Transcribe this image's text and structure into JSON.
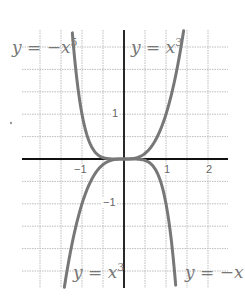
{
  "chart_data": {
    "type": "line",
    "title": "",
    "xlabel": "",
    "ylabel": "",
    "xlim": [
      -2.0,
      2.5
    ],
    "ylim": [
      -2.85,
      2.85
    ],
    "grid": true,
    "grid_step": 0.5,
    "x_ticks": [
      {
        "value": -1,
        "label": "−1"
      },
      {
        "value": 1,
        "label": "1"
      },
      {
        "value": 2,
        "label": "2"
      }
    ],
    "y_ticks": [
      {
        "value": 1,
        "label": "1"
      },
      {
        "value": -1,
        "label": "−1"
      }
    ],
    "series": [
      {
        "name": "y = x^3",
        "expr": "x^3",
        "x_range": [
          -1.42,
          1.42
        ],
        "color": "#777777"
      },
      {
        "name": "y = -x^5",
        "expr": "-x^5",
        "x_range": [
          -1.23,
          1.23
        ],
        "color": "#777777"
      }
    ],
    "annotations": [
      {
        "text": "y = −x",
        "sup": "5",
        "position": "top-left"
      },
      {
        "text": "y = x",
        "sup": "3",
        "position": "top-right"
      },
      {
        "text": "y = x",
        "sup": "3",
        "position": "bottom-left"
      },
      {
        "text": "y = −x",
        "sup": "5",
        "position": "bottom-right"
      }
    ]
  },
  "labels": {
    "top_left": {
      "text": "y = −x",
      "sup": "5"
    },
    "top_right": {
      "text": "y = x",
      "sup": "3"
    },
    "bottom_left": {
      "text": "y = x",
      "sup": "3"
    },
    "bottom_right": {
      "text": "y = −x",
      "sup": "5"
    }
  },
  "ticks": {
    "x_neg1": "−1",
    "x_1": "1",
    "x_2": "2",
    "y_1": "1",
    "y_neg1": "−1"
  },
  "colors": {
    "curve": "#777777",
    "axis": "#111111",
    "grid": "#bbbbbb"
  }
}
